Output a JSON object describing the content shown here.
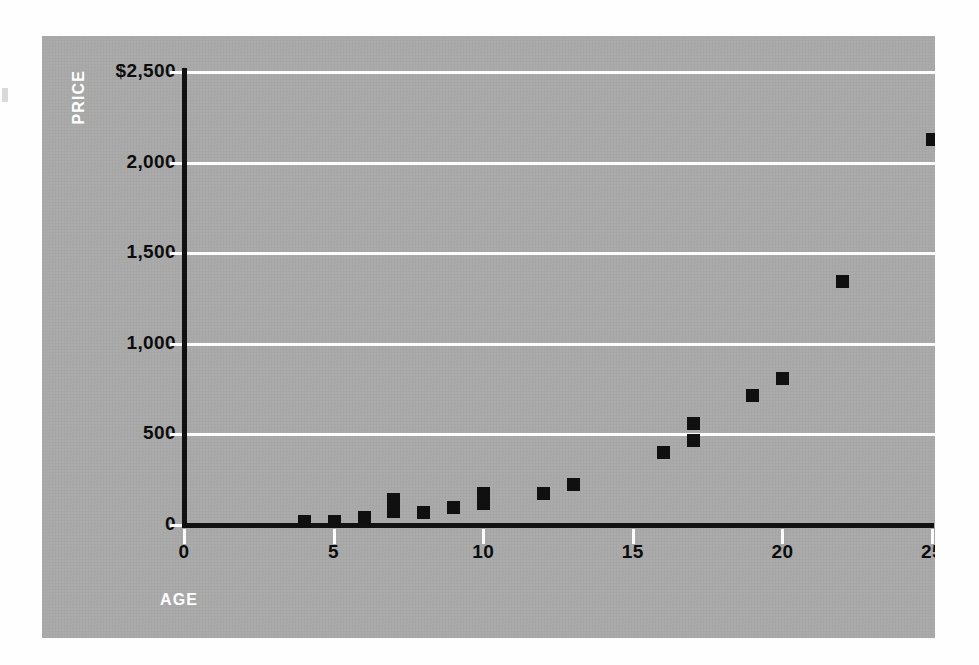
{
  "chart_data": {
    "type": "scatter",
    "title": "",
    "xlabel": "AGE",
    "ylabel": "PRICE",
    "xlim": [
      0,
      25
    ],
    "ylim": [
      0,
      2500
    ],
    "grid": true,
    "legend": "none",
    "x_ticks": [
      "0",
      "5",
      "10",
      "15",
      "20",
      "25"
    ],
    "x_tick_values": [
      0,
      5,
      10,
      15,
      20,
      25
    ],
    "y_ticks": [
      "0",
      "500",
      "1,000",
      "1,500",
      "2,000",
      "$2,500"
    ],
    "y_tick_values": [
      0,
      500,
      1000,
      1500,
      2000,
      2500
    ],
    "marker": "square",
    "marker_color": "#101010",
    "points": [
      {
        "x": 4,
        "y": 20
      },
      {
        "x": 5,
        "y": 22
      },
      {
        "x": 6,
        "y": 45
      },
      {
        "x": 7,
        "y": 75
      },
      {
        "x": 7,
        "y": 145
      },
      {
        "x": 8,
        "y": 70
      },
      {
        "x": 9,
        "y": 100
      },
      {
        "x": 10,
        "y": 120
      },
      {
        "x": 10,
        "y": 175
      },
      {
        "x": 12,
        "y": 175
      },
      {
        "x": 13,
        "y": 225
      },
      {
        "x": 16,
        "y": 405
      },
      {
        "x": 17,
        "y": 470
      },
      {
        "x": 17,
        "y": 565
      },
      {
        "x": 19,
        "y": 715
      },
      {
        "x": 20,
        "y": 810
      },
      {
        "x": 22,
        "y": 1345
      },
      {
        "x": 25,
        "y": 2130
      }
    ]
  },
  "style": {
    "panel_background": "#a9a9a9",
    "grid_color": "#fdfdfd",
    "axis_color": "#111111",
    "tick_label_color": "#0c0c0c",
    "axis_title_color": "#ffffff",
    "page_background": "#fefefe"
  }
}
